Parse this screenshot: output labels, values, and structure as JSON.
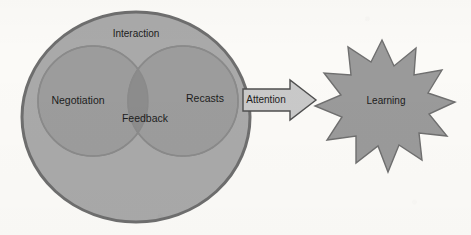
{
  "figure": {
    "type": "venn-flow-diagram",
    "background_color": "#fbfaf7",
    "outer_set": {
      "label": "Interaction",
      "shape": "ellipse",
      "fill_color": "#a9a9a9",
      "stroke_color": "#6e6e6e"
    },
    "subsets": [
      {
        "label": "Negotiation",
        "shape": "circle",
        "fill_color": "#9c9c9c",
        "stroke_color": "#878787"
      },
      {
        "label": "Recasts",
        "shape": "circle",
        "fill_color": "#9c9c9c",
        "stroke_color": "#878787"
      }
    ],
    "intersection": {
      "label": "Feedback",
      "fill_color": "#8e8e8e"
    },
    "connector": {
      "label": "Attention",
      "shape": "block-arrow",
      "direction": "right",
      "fill_color": "#c9c9c9",
      "stroke_color": "#4f4f4f"
    },
    "outcome": {
      "label": "Learning",
      "shape": "starburst",
      "points": 12,
      "fill_color": "#9a9a9a",
      "stroke_color": "#6f6f6f"
    },
    "text_color": "#1c1c1c"
  }
}
